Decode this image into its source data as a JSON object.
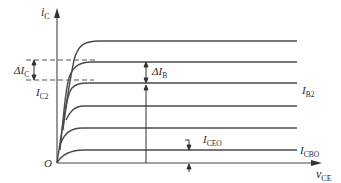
{
  "diagram": {
    "axes": {
      "y_label": {
        "main": "i",
        "sub": "C"
      },
      "x_label": {
        "main": "v",
        "sub": "CE"
      },
      "origin_label": "O"
    },
    "curves": [
      {
        "id": "curve-6",
        "plateau_y": 41
      },
      {
        "id": "curve-5",
        "plateau_y": 62
      },
      {
        "id": "curve-4-IB2",
        "plateau_y": 83,
        "label": {
          "main": "I",
          "sub": "B2"
        }
      },
      {
        "id": "curve-3",
        "plateau_y": 106
      },
      {
        "id": "curve-2",
        "plateau_y": 128
      },
      {
        "id": "curve-1-ICBO",
        "plateau_y": 150,
        "label": {
          "main": "I",
          "sub": "CBO"
        }
      }
    ],
    "annotations": {
      "delta_ic": {
        "main": "ΔI",
        "sub": "C"
      },
      "ic2": {
        "main": "I",
        "sub": "C2"
      },
      "delta_ib": {
        "main": "ΔI",
        "sub": "B"
      },
      "iceo": {
        "main": "I",
        "sub": "CEO"
      }
    },
    "colors": {
      "line": "#4a4a4a",
      "text": "#2a2a2a",
      "background": "#ffffff"
    }
  }
}
